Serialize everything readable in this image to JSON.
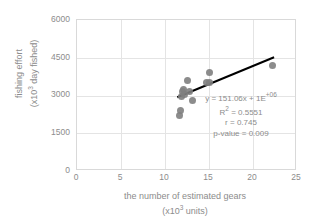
{
  "chart_data": {
    "type": "scatter",
    "title": "",
    "xlabel": "the number of estimated gears (x10³ units)",
    "ylabel": "fishing effort (x10³ day fished)",
    "xlabel_line1": "the number of estimated gears",
    "xlabel_line2_pre": "(x10",
    "xlabel_line2_sup": "3",
    "xlabel_line2_post": " units)",
    "ylabel_line1": "fishing effort",
    "ylabel_line2_pre": "(x10",
    "ylabel_line2_sup": "3",
    "ylabel_line2_post": " day fished)",
    "xlim": [
      0,
      25
    ],
    "ylim": [
      0,
      6000
    ],
    "xticks": [
      0,
      5,
      10,
      15,
      20,
      25
    ],
    "yticks": [
      0,
      1500,
      3000,
      4500,
      6000
    ],
    "grid": true,
    "legend": "none",
    "marker_color": "#7f7f7f",
    "trendline_color": "#000000",
    "gridline_color": "#e4e4e4",
    "axis_text_color": "#8c8c8c",
    "points": [
      {
        "x": 11.6,
        "y": 2200
      },
      {
        "x": 11.8,
        "y": 2400
      },
      {
        "x": 11.9,
        "y": 2950
      },
      {
        "x": 12.0,
        "y": 3150
      },
      {
        "x": 12.1,
        "y": 3250
      },
      {
        "x": 12.2,
        "y": 3050
      },
      {
        "x": 12.5,
        "y": 3600
      },
      {
        "x": 12.8,
        "y": 3150
      },
      {
        "x": 13.1,
        "y": 2800
      },
      {
        "x": 14.7,
        "y": 3500
      },
      {
        "x": 15.0,
        "y": 3900
      },
      {
        "x": 15.1,
        "y": 3500
      },
      {
        "x": 22.2,
        "y": 4180
      }
    ],
    "trendline": {
      "x_start": 11.5,
      "y_start": 2890,
      "x_end": 22.6,
      "y_end": 4500,
      "slope": 151.06,
      "intercept": 1000000
    },
    "annotation": {
      "equation_pre": "y = 151.06x + 1E",
      "equation_sup": "+06",
      "r_squared_pre": "R",
      "r_squared_sup": "2",
      "r_squared_post": " = 0.5551",
      "r_value": "r = 0.745",
      "p_value": "p-value = 0.009"
    }
  }
}
